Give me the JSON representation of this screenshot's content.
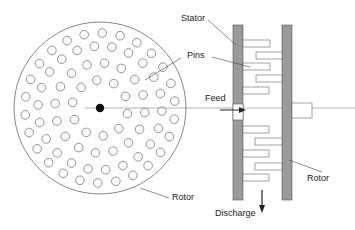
{
  "diagram": {
    "type": "pin mill schematic",
    "labels": {
      "stator": "Stator",
      "pins": "Pins",
      "feed": "Feed",
      "rotor_face": "Rotor",
      "rotor_side": "Rotor",
      "discharge": "Discharge"
    },
    "components": [
      {
        "name": "rotor disk face view",
        "shape": "circle with concentric rings of pin holes"
      },
      {
        "name": "stator plate",
        "shape": "vertical shaded bar"
      },
      {
        "name": "rotor plate",
        "shape": "vertical shaded bar with shaft"
      },
      {
        "name": "pins",
        "shape": "interleaved rectangles"
      }
    ],
    "colors": {
      "line": "#555555",
      "plate": "#9a9a9a",
      "text": "#222222"
    }
  }
}
